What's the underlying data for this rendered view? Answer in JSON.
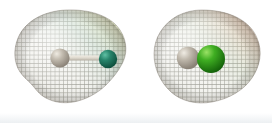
{
  "figure": {
    "type": "molecular-electron-density-surfaces",
    "background_color": "#ffffff",
    "width": 272,
    "height": 123,
    "panel_count": 2,
    "description": "Two side-by-side wireframe mesh electron density surfaces enclosing ball-and-stick diatomic molecules"
  },
  "molecules": [
    {
      "id": "left-molecule",
      "label": "",
      "surface": {
        "name": "electron-density-mesh-left",
        "shape": "peanut-kidney",
        "mesh_color": "#8f8f86",
        "fill_color": "#f2f2ee",
        "tint_highlight": "#c9d18a",
        "tint_secondary": "#9fc2ad",
        "tint_shadow": "#8b8177",
        "center_x": 70,
        "center_y": 60,
        "radius_x": 56,
        "radius_y": 50
      },
      "atoms": [
        {
          "name": "atom-hydrogen-left",
          "element_color": "#b5aea2",
          "highlight_color": "#e4e0d6",
          "cx": 60,
          "cy": 58,
          "r": 9
        },
        {
          "name": "atom-halogen-left",
          "element_color": "#1f7a62",
          "highlight_color": "#4fae93",
          "cx": 108,
          "cy": 59,
          "r": 9
        }
      ],
      "bond": {
        "name": "bond-left",
        "color": "#d8d4ca",
        "x1": 63,
        "y1": 58,
        "x2": 104,
        "y2": 59,
        "width": 5
      }
    },
    {
      "id": "right-molecule",
      "label": "",
      "surface": {
        "name": "electron-density-mesh-right",
        "shape": "ovoid-egg",
        "mesh_color": "#8f8f86",
        "fill_color": "#f2f2ee",
        "tint_highlight": "#d9a88a",
        "tint_secondary": "#b7c8a8",
        "tint_shadow": "#8b8177",
        "center_x": 201,
        "center_y": 60,
        "radius_x": 58,
        "radius_y": 50
      },
      "atoms": [
        {
          "name": "atom-hydrogen-right",
          "element_color": "#b0aaa0",
          "highlight_color": "#e2ded4",
          "cx": 188,
          "cy": 59,
          "r": 11
        },
        {
          "name": "atom-halogen-right",
          "element_color": "#2f9c1e",
          "highlight_color": "#7ed35e",
          "cx": 211,
          "cy": 59,
          "r": 14
        }
      ],
      "bond": {
        "name": "bond-right",
        "color": "#cfcbc1",
        "x1": 190,
        "y1": 59,
        "x2": 208,
        "y2": 59,
        "width": 7
      }
    }
  ],
  "colors": {
    "background": "#ffffff",
    "mesh_line": "#8f8f86",
    "surface_fill": "#f2f2ee",
    "green_bright": "#2f9c1e",
    "green_teal": "#1f7a62",
    "grey_atom": "#b5aea2",
    "orange_tint": "#d9a88a",
    "yellow_tint": "#c9d18a",
    "bottom_haze": "#eef0f2"
  }
}
